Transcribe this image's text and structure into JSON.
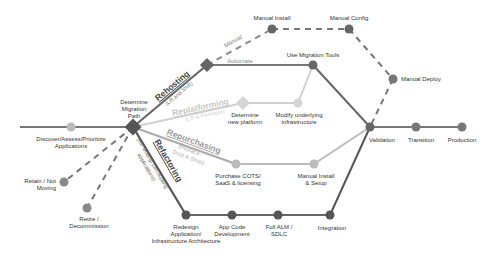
{
  "colors": {
    "dark": "#555555",
    "mid": "#777777",
    "light": "#bdbdbd",
    "lighter": "#d0d0d0",
    "node_dark": "#5e5e5e",
    "node_light": "#c8c8c8"
  },
  "main_line": {
    "discover": "Discover/Assess/Prioritize",
    "discover_2": "Applications",
    "determine": "Determine",
    "determine_2": "Migration",
    "determine_3": "Path",
    "validation": "Validation",
    "transition": "Transition",
    "production": "Production"
  },
  "side_exits": {
    "retain": "Retain / Not",
    "retain_2": "Moving",
    "retire": "Retire /",
    "retire_2": "Decommission"
  },
  "rehosting": {
    "title": "Rehosting",
    "subtitle": "(Lift and Shift)",
    "manual_label": "Manual",
    "automate_label": "Automate",
    "manual_install": "Manual Install",
    "manual_config": "Manual Config",
    "manual_deploy": "Manual Deploy",
    "use_migration_tools": "Use Migration Tools"
  },
  "replatforming": {
    "title": "Replatforming",
    "subtitle": "(Lift & Reshape)",
    "determine_platform": "Determine",
    "determine_platform_2": "new platform",
    "modify_infra": "Modify underlying",
    "modify_infra_2": "infrastructure"
  },
  "repurchasing": {
    "title": "Repurchasing",
    "subtitle": "(Replace -",
    "subtitle_2": "Drop & Shop)",
    "purchase": "Purchase COTS/",
    "purchase_2": "SaaS & licensing",
    "manual_install_setup": "Manual Install",
    "manual_install_setup_2": "& Setup"
  },
  "refactoring": {
    "title": "Refactoring",
    "subtitle": "(Re-writing/ Decoupling",
    "subtitle_2": "applications)",
    "redesign": "Redesign",
    "redesign_2": "Application/",
    "redesign_3": "Infrastructure Architecture",
    "app_code": "App Code",
    "app_code_2": "Development",
    "full_alm": "Full ALM /",
    "full_alm_2": "SDLC",
    "integration": "Integration"
  }
}
